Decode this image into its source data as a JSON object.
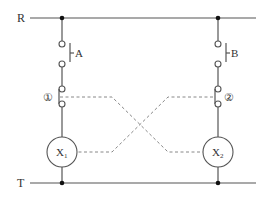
{
  "diagram": {
    "type": "relay interlock circuit",
    "rails": {
      "top": {
        "label": "R"
      },
      "bottom": {
        "label": "T"
      }
    },
    "branches": [
      {
        "switch_label": "A",
        "contact_label": "①",
        "coil_label": "X",
        "coil_subscript": "1"
      },
      {
        "switch_label": "B",
        "contact_label": "②",
        "coil_label": "X",
        "coil_subscript": "2"
      }
    ],
    "colors": {
      "wire": "#555555",
      "dashed_link": "#888888",
      "node": "#111111"
    }
  }
}
